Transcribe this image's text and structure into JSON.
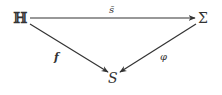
{
  "diagram": {
    "type": "commutative-diagram",
    "nodes": {
      "top_left": "ℍ",
      "top_right": "Σ",
      "bottom": "S"
    },
    "arrows": {
      "top": {
        "from": "ℍ",
        "to": "Σ",
        "label": "s̄"
      },
      "left": {
        "from": "ℍ",
        "to": "S",
        "label": "f"
      },
      "right": {
        "from": "Σ",
        "to": "S",
        "label": "φ"
      }
    },
    "colors": {
      "stroke": "#333333",
      "background": "#ffffff"
    }
  }
}
